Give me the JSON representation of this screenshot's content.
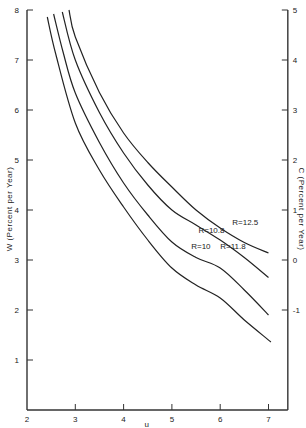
{
  "chart_data": {
    "type": "line",
    "title": "",
    "xlabel": "u",
    "ylabel": "W (Percent per Year)",
    "y2label": "C (Percent per Year)",
    "xlim": [
      2,
      7.4
    ],
    "ylim": [
      0,
      8
    ],
    "y2lim": [
      -3,
      5
    ],
    "x_ticks": [
      2,
      3,
      4,
      5,
      6,
      7
    ],
    "y_ticks": [
      1,
      2,
      3,
      4,
      5,
      6,
      7,
      8
    ],
    "y2_ticks": [
      -1,
      0,
      1,
      2,
      3,
      4,
      5
    ],
    "grid": false,
    "legend": "inline labels",
    "series": [
      {
        "name": "R=10",
        "label": "R=10",
        "x": [
          2.42,
          2.6,
          3.0,
          3.5,
          4.0,
          4.5,
          5.0,
          5.5,
          6.0,
          6.5,
          7.05
        ],
        "y": [
          7.86,
          7.1,
          5.74,
          4.8,
          4.06,
          3.4,
          2.84,
          2.5,
          2.24,
          1.8,
          1.36
        ],
        "label_pos": {
          "x": 5.4,
          "y": 3.22
        }
      },
      {
        "name": "R=10.8",
        "label": "R=10.8",
        "x": [
          2.55,
          2.75,
          3.0,
          3.5,
          4.0,
          4.5,
          5.0,
          5.5,
          6.0,
          6.5,
          7.0
        ],
        "y": [
          7.92,
          7.15,
          6.34,
          5.35,
          4.54,
          3.9,
          3.36,
          3.05,
          2.84,
          2.4,
          1.9
        ],
        "label_pos": {
          "x": 5.55,
          "y": 3.55
        }
      },
      {
        "name": "R=11.8",
        "label": "R=11.8",
        "x": [
          2.73,
          3.0,
          3.5,
          4.0,
          4.5,
          5.0,
          5.5,
          6.0,
          6.5,
          7.0
        ],
        "y": [
          7.96,
          7.0,
          5.95,
          5.14,
          4.5,
          4.0,
          3.7,
          3.4,
          3.05,
          2.65
        ],
        "label_pos": {
          "x": 6.0,
          "y": 3.22
        }
      },
      {
        "name": "R=12.5",
        "label": "R=12.5",
        "x": [
          2.87,
          3.0,
          3.5,
          4.0,
          4.5,
          5.0,
          5.5,
          6.0,
          6.5,
          7.0
        ],
        "y": [
          8.0,
          7.46,
          6.35,
          5.54,
          4.95,
          4.46,
          4.0,
          3.64,
          3.35,
          3.14
        ],
        "label_pos": {
          "x": 6.25,
          "y": 3.7
        }
      }
    ]
  },
  "axes": {
    "x_title": "u",
    "y_title": "W  (Percent  per  Year)",
    "y2_title": "C  (Percent  per  Year)"
  }
}
